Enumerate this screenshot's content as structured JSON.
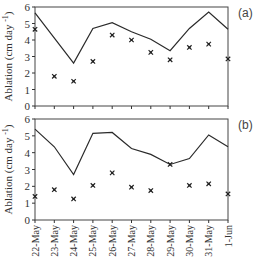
{
  "figure": {
    "panel_a_label": "(a)",
    "panel_b_label": "(b)",
    "ylabel": "Ablation (cm day",
    "ylabel_superscript": "-1",
    "ylabel_close": ")"
  },
  "chart_data": [
    {
      "type": "line",
      "panel": "(a)",
      "title": "",
      "xlabel": "",
      "ylabel": "Ablation (cm day^-1)",
      "ylim": [
        0,
        6
      ],
      "yticks": [
        0,
        1,
        2,
        3,
        4,
        5,
        6
      ],
      "grid": false,
      "legend": null,
      "categories": [
        "22-May",
        "23-May",
        "24-May",
        "25-May",
        "26-May",
        "27-May",
        "28-May",
        "29-May",
        "30-May",
        "31-May",
        "1-Jun"
      ],
      "series": [
        {
          "name": "line",
          "style": "solid-line",
          "values": [
            5.65,
            null,
            2.6,
            4.7,
            5.05,
            4.5,
            4.05,
            3.35,
            4.7,
            5.7,
            4.65
          ]
        },
        {
          "name": "markers",
          "style": "x-marker",
          "values": [
            4.65,
            1.8,
            1.5,
            2.7,
            4.3,
            4.0,
            3.25,
            2.8,
            3.55,
            3.75,
            2.85
          ]
        }
      ]
    },
    {
      "type": "line",
      "panel": "(b)",
      "title": "",
      "xlabel": "",
      "ylabel": "Ablation (cm day^-1)",
      "ylim": [
        0,
        6
      ],
      "yticks": [
        0,
        1,
        2,
        3,
        4,
        5,
        6
      ],
      "grid": false,
      "legend": null,
      "categories": [
        "22-May",
        "23-May",
        "24-May",
        "25-May",
        "26-May",
        "27-May",
        "28-May",
        "29-May",
        "30-May",
        "31-May",
        "1-Jun"
      ],
      "series": [
        {
          "name": "line",
          "style": "solid-line",
          "values": [
            5.4,
            4.35,
            2.7,
            5.15,
            5.2,
            4.25,
            3.9,
            3.3,
            3.65,
            5.05,
            4.35
          ]
        },
        {
          "name": "markers",
          "style": "x-marker",
          "values": [
            1.4,
            1.8,
            1.25,
            2.05,
            2.8,
            1.95,
            1.75,
            3.3,
            2.05,
            2.15,
            1.55
          ]
        }
      ]
    }
  ]
}
